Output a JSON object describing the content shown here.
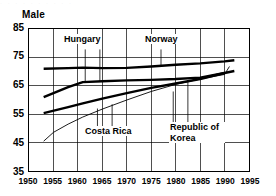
{
  "chart": {
    "title": "Male",
    "ghost_top_text": "· · · · · · · · · ·"
  },
  "axes": {
    "y_ticks": [
      "85",
      "75",
      "65",
      "55",
      "45",
      "35"
    ],
    "x_ticks": [
      "1950",
      "1955",
      "1960",
      "1965",
      "1970",
      "1975",
      "1980",
      "1985",
      "1990",
      "1995"
    ]
  },
  "labels": {
    "hungary": "Hungary",
    "norway": "Norway",
    "costa_rica": "Costa Rica",
    "korea": "Republic of Korea"
  },
  "chart_data": {
    "type": "line",
    "title": "Male",
    "xlabel": "",
    "ylabel": "",
    "xlim": [
      1950,
      1995
    ],
    "ylim": [
      35,
      85
    ],
    "ytick_interval": 10,
    "xtick_interval": 5,
    "grid": true,
    "legend": "inline-annotations",
    "annotations": [
      {
        "text": "Hungary",
        "x": 1963.0,
        "y": 78.5,
        "leader_to": [
          [
            1961.5,
            66.5
          ],
          [
            1964.5,
            66.6
          ]
        ]
      },
      {
        "text": "Norway",
        "x": 1977.0,
        "y": 78.5,
        "leader_to": [
          [
            1977.0,
            71.8
          ]
        ]
      },
      {
        "text": "Costa Rica",
        "x": 1966.5,
        "y": 50.0,
        "leader_to": [
          [
            1964.0,
            57.0
          ],
          [
            1967.0,
            58.5
          ]
        ]
      },
      {
        "text": "Republic of Korea",
        "x": 1983.0,
        "y": 50.5,
        "leader_to": [
          [
            1979.5,
            63.0
          ],
          [
            1982.5,
            66.5
          ]
        ]
      }
    ],
    "series": [
      {
        "name": "Norway",
        "style": "thick",
        "x": [
          1953,
          1958,
          1961,
          1965,
          1970,
          1975,
          1980,
          1985,
          1990,
          1992
        ],
        "values": [
          71.0,
          71.2,
          71.4,
          71.2,
          71.3,
          71.8,
          72.4,
          72.9,
          73.6,
          74.0
        ]
      },
      {
        "name": "Hungary",
        "style": "thick",
        "x": [
          1953,
          1958,
          1961,
          1965,
          1970,
          1975,
          1980,
          1985,
          1990,
          1992
        ],
        "values": [
          61.0,
          64.5,
          66.3,
          66.6,
          66.9,
          67.1,
          67.4,
          67.9,
          69.5,
          70.2
        ]
      },
      {
        "name": "Republic of Korea",
        "style": "thick",
        "x": [
          1953,
          1958,
          1961,
          1965,
          1970,
          1975,
          1980,
          1985,
          1990
        ],
        "values": [
          55.4,
          57.5,
          58.8,
          60.5,
          62.4,
          64.3,
          65.8,
          67.4,
          69.5
        ]
      },
      {
        "name": "Costa Rica",
        "style": "thin",
        "x": [
          1953,
          1955,
          1958,
          1961,
          1965,
          1970,
          1975,
          1980,
          1985,
          1990,
          1991
        ],
        "values": [
          45.5,
          48.6,
          51.5,
          54.0,
          56.8,
          60.0,
          63.0,
          65.5,
          67.4,
          69.0,
          71.8
        ]
      }
    ]
  }
}
